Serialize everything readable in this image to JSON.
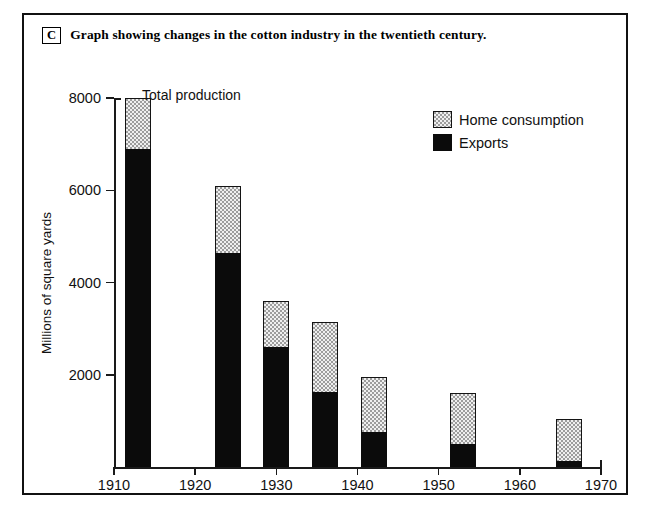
{
  "caption": {
    "letter": "C",
    "text": "Graph showing changes in the cotton industry in the twentieth century."
  },
  "annotation": {
    "total_production": "Total production"
  },
  "legend": {
    "position": "top-right",
    "items": [
      {
        "label": "Home consumption",
        "color": "#efefef",
        "swatch": "dotted-light"
      },
      {
        "label": "Exports",
        "color": "#0b0b0b",
        "swatch": "solid-black"
      }
    ]
  },
  "chart_data": {
    "type": "bar",
    "stacked": true,
    "title": "Graph showing changes in the cotton industry in the twentieth century.",
    "subtitle": "",
    "xlabel": "",
    "ylabel": "Millions of square yards",
    "xlim": [
      1910,
      1970
    ],
    "ylim": [
      0,
      8000
    ],
    "grid": false,
    "legend_position": "top-right",
    "x": [
      1913,
      1924,
      1930,
      1936,
      1942,
      1953,
      1966
    ],
    "categories": [
      "1913",
      "1924",
      "1930",
      "1936",
      "1942",
      "1953",
      "1966"
    ],
    "series": [
      {
        "name": "Exports",
        "color": "#0b0b0b",
        "values": [
          6900,
          4650,
          2600,
          1620,
          750,
          500,
          120
        ]
      },
      {
        "name": "Home consumption",
        "color": "#efefef",
        "values": [
          1100,
          1450,
          1000,
          1530,
          1200,
          1100,
          930
        ]
      }
    ],
    "totals": [
      8000,
      6100,
      3600,
      3150,
      1950,
      1600,
      1050
    ],
    "annotations": [
      {
        "text": "Total production",
        "x": 1913,
        "y": 8000
      }
    ],
    "y_ticks": [
      2000,
      4000,
      6000,
      8000
    ],
    "y_tick_labels": [
      "2000",
      "4000",
      "6000",
      "8000"
    ],
    "x_ticks": [
      1910,
      1920,
      1930,
      1940,
      1950,
      1960,
      1970
    ],
    "x_tick_labels": [
      "1910",
      "1920",
      "1930",
      "1940",
      "1950",
      "1960",
      "1970"
    ]
  }
}
